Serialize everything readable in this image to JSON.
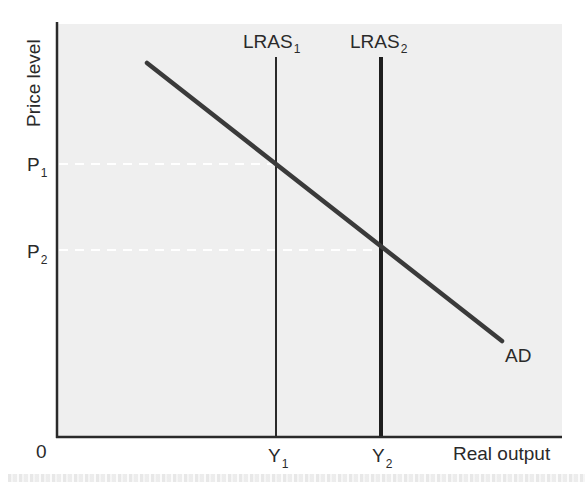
{
  "diagram": {
    "type": "AD-LRAS economic diagram",
    "background_color": "#efefef",
    "axis_color": "#2a2a2a",
    "y_axis": {
      "label": "Price level",
      "ticks": [
        {
          "label": "P",
          "sub": "1"
        },
        {
          "label": "P",
          "sub": "2"
        }
      ]
    },
    "x_axis": {
      "label": "Real output",
      "origin_label": "0",
      "ticks": [
        {
          "label": "Y",
          "sub": "1"
        },
        {
          "label": "Y",
          "sub": "2"
        }
      ]
    },
    "curves": {
      "lras1": {
        "label": "LRAS",
        "sub": "1"
      },
      "lras2": {
        "label": "LRAS",
        "sub": "2"
      },
      "ad": {
        "label": "AD"
      }
    },
    "guide_lines": {
      "style": "dashed",
      "color": "#ffffff"
    }
  }
}
